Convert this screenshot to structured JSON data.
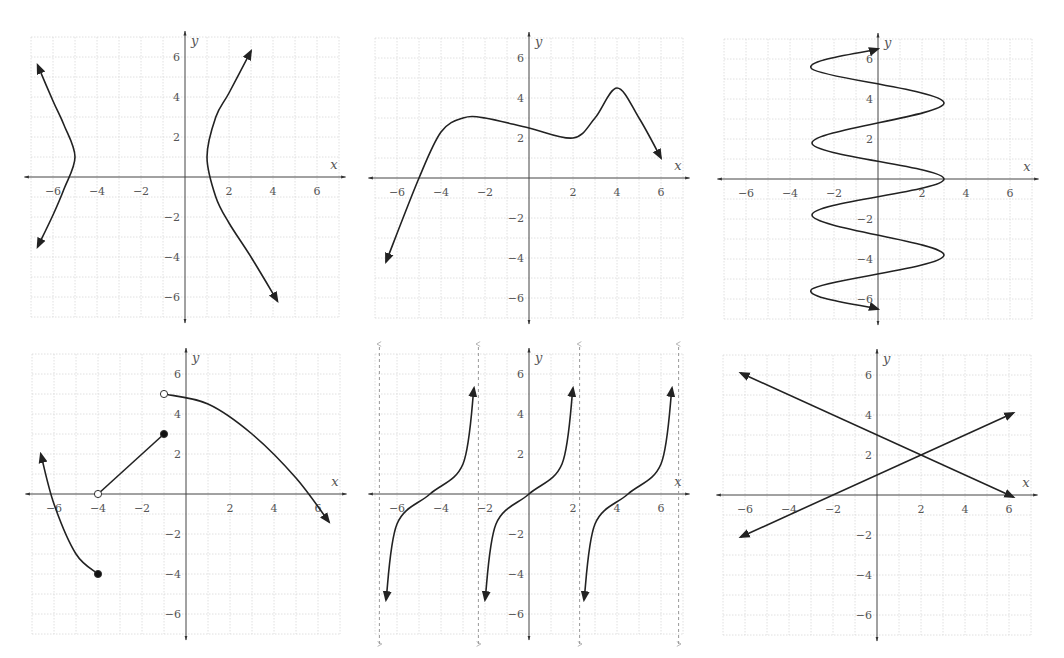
{
  "chart_data": [
    {
      "id": "A",
      "type": "line",
      "title": "",
      "xlabel": "x",
      "ylabel": "y",
      "xlim": [
        -7,
        7
      ],
      "ylim": [
        -7,
        7
      ],
      "x_ticks": [
        -6,
        -4,
        -2,
        2,
        4,
        6
      ],
      "y_ticks": [
        6,
        4,
        2,
        -2,
        -4,
        -6
      ],
      "grid": true,
      "description": "Horizontal hyperbola centered at (-2, 1), vertices at (-5, 1) and (1, 1)",
      "series": [
        {
          "name": "left branch",
          "x": [
            -6.7,
            -6,
            -5.5,
            -5,
            -5.5,
            -6,
            -6.7
          ],
          "y": [
            5.6,
            3.8,
            2.6,
            1,
            -0.6,
            -1.9,
            -3.5
          ],
          "arrows": "both"
        },
        {
          "name": "right branch",
          "x": [
            3,
            2,
            1.4,
            1,
            1.4,
            2,
            3,
            4.2
          ],
          "y": [
            6.3,
            4.2,
            3,
            1,
            -1,
            -2.3,
            -4,
            -6.2
          ],
          "arrows": "both"
        }
      ]
    },
    {
      "id": "B",
      "type": "line",
      "xlabel": "x",
      "ylabel": "y",
      "xlim": [
        -7,
        7
      ],
      "ylim": [
        -7,
        7
      ],
      "x_ticks": [
        -6,
        -4,
        -2,
        2,
        4,
        6
      ],
      "y_ticks": [
        6,
        4,
        2,
        -2,
        -4,
        -6
      ],
      "grid": true,
      "description": "Continuous function: local max near (-2.5, 3), local min at (2, 2), local max at (4, 4.5)",
      "series": [
        {
          "name": "f",
          "x": [
            -6.5,
            -5,
            -4,
            -3,
            -2,
            0,
            2,
            3,
            4,
            5,
            6
          ],
          "y": [
            -4.2,
            0,
            2.3,
            3,
            3,
            2.5,
            2,
            3,
            4.5,
            3,
            1
          ],
          "arrows": "both"
        }
      ]
    },
    {
      "id": "C",
      "type": "line",
      "xlabel": "x",
      "ylabel": "y",
      "xlim": [
        -7,
        7
      ],
      "ylim": [
        -7,
        7
      ],
      "x_ticks": [
        -6,
        -4,
        -2,
        2,
        4,
        6
      ],
      "y_ticks": [
        6,
        4,
        2,
        -2,
        -4,
        -6
      ],
      "grid": true,
      "description": "Sideways sinusoid x = 3 sin(...) oscillating in y from about -6.5 to 6.5, amplitude 3",
      "series": [
        {
          "name": "sideways sine",
          "x": [
            0,
            -3,
            3,
            -3,
            3,
            -3,
            3,
            -3,
            0
          ],
          "y": [
            6.5,
            5.5,
            3.8,
            1.8,
            0,
            -1.8,
            -3.8,
            -5.5,
            -6.5
          ],
          "arrows": "both"
        }
      ]
    },
    {
      "id": "D",
      "type": "line",
      "xlabel": "x",
      "ylabel": "y",
      "xlim": [
        -7,
        7
      ],
      "ylim": [
        -7,
        7
      ],
      "x_ticks": [
        -6,
        -4,
        -2,
        2,
        4,
        6
      ],
      "y_ticks": [
        6,
        4,
        2,
        -2,
        -4,
        -6
      ],
      "grid": true,
      "description": "Piecewise function",
      "series": [
        {
          "name": "piece 1 (curve)",
          "x": [
            -6.6,
            -6,
            -5,
            -4
          ],
          "y": [
            2,
            -0.5,
            -3,
            -4
          ],
          "start": "arrow",
          "end": "closed"
        },
        {
          "name": "piece 2 (segment)",
          "x": [
            -4,
            -1
          ],
          "y": [
            0,
            3
          ],
          "start": "open",
          "end": "closed"
        },
        {
          "name": "piece 3 (curve)",
          "x": [
            -1,
            1,
            3,
            5,
            6.5
          ],
          "y": [
            5,
            4.5,
            3,
            0.8,
            -1.4
          ],
          "start": "open",
          "end": "arrow"
        }
      ],
      "points": [
        {
          "x": -4,
          "y": -4,
          "style": "closed"
        },
        {
          "x": -4,
          "y": 0,
          "style": "open"
        },
        {
          "x": -1,
          "y": 3,
          "style": "closed"
        },
        {
          "x": -1,
          "y": 5,
          "style": "open"
        }
      ]
    },
    {
      "id": "E",
      "type": "line",
      "xlabel": "x",
      "ylabel": "y",
      "xlim": [
        -7,
        7
      ],
      "ylim": [
        -7,
        7
      ],
      "x_ticks": [
        -6,
        -4,
        -2,
        2,
        4,
        6
      ],
      "y_ticks": [
        6,
        4,
        2,
        -2,
        -4,
        -6
      ],
      "grid": true,
      "description": "Tangent-like function with period ~4.5 and vertical asymptotes (dashed)",
      "asymptotes_x": [
        -6.8,
        -2.3,
        2.3,
        6.8
      ],
      "series": [
        {
          "name": "branch 1",
          "x": [
            -6.5,
            -6,
            -4.5,
            -3,
            -2.5
          ],
          "y": [
            -5.3,
            -1.5,
            0,
            1.5,
            5.3
          ],
          "arrows": "both"
        },
        {
          "name": "branch 2",
          "x": [
            -2,
            -1.5,
            0,
            1.5,
            2
          ],
          "y": [
            -5.3,
            -1.5,
            0,
            1.5,
            5.3
          ],
          "arrows": "both"
        },
        {
          "name": "branch 3",
          "x": [
            2.5,
            3,
            4.5,
            6,
            6.5
          ],
          "y": [
            -5.3,
            -1.5,
            0,
            1.5,
            5.3
          ],
          "arrows": "both"
        }
      ]
    },
    {
      "id": "F",
      "type": "line",
      "xlabel": "x",
      "ylabel": "y",
      "xlim": [
        -7,
        7
      ],
      "ylim": [
        -7,
        7
      ],
      "x_ticks": [
        -6,
        -4,
        -2,
        2,
        4,
        6
      ],
      "y_ticks": [
        6,
        4,
        2,
        -2,
        -4,
        -6
      ],
      "grid": true,
      "description": "Two lines intersecting at (2, 2)",
      "series": [
        {
          "name": "decreasing line",
          "x": [
            -6.2,
            6.2
          ],
          "y": [
            6.1,
            -0.1
          ],
          "equation": "y = -0.5x + 3",
          "arrows": "both"
        },
        {
          "name": "increasing line",
          "x": [
            -6.2,
            6.2
          ],
          "y": [
            -2.1,
            4.1
          ],
          "equation": "y = 0.5x + 1",
          "arrows": "both"
        }
      ],
      "points": [
        {
          "x": 2,
          "y": 2,
          "label": "intersection"
        }
      ]
    }
  ],
  "panels": [
    {
      "id": "A",
      "ox": 185,
      "oy": 177
    },
    {
      "id": "B",
      "ox": 529,
      "oy": 178
    },
    {
      "id": "C",
      "ox": 878,
      "oy": 179
    },
    {
      "id": "D",
      "ox": 186,
      "oy": 494
    },
    {
      "id": "E",
      "ox": 529,
      "oy": 494
    },
    {
      "id": "F",
      "ox": 877,
      "oy": 495
    }
  ],
  "axis": {
    "x_label": "x",
    "y_label": "y",
    "x_ticks": [
      "−6",
      "−4",
      "−2",
      "2",
      "4",
      "6"
    ],
    "y_ticks": [
      "6",
      "4",
      "2",
      "−2",
      "−4",
      "−6"
    ]
  }
}
